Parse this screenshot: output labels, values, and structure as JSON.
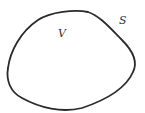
{
  "diagram": {
    "type": "closed-region",
    "volume_label": "V",
    "surface_label": "S",
    "stroke_color": "#2a2a2a"
  }
}
